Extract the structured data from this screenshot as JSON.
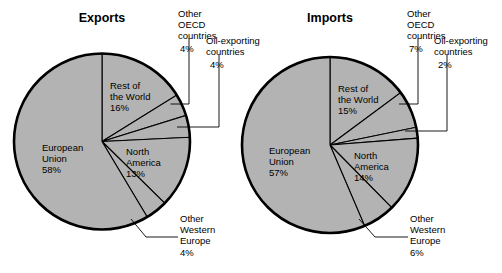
{
  "figure": {
    "background": "#ffffff",
    "slice_fill": "#b3b3b3",
    "outline_color": "#000000"
  },
  "chart_data": [
    {
      "type": "pie",
      "title": "Exports",
      "labels": [
        "Rest of the World",
        "Other OECD countries",
        "Oil-exporting countries",
        "North America",
        "Other Western Europe",
        "European Union"
      ],
      "values": [
        16,
        4,
        4,
        13,
        4,
        58
      ],
      "value_suffix": "%",
      "start_angle_deg": 0,
      "direction": "clockwise",
      "legend": "none",
      "grid": false
    },
    {
      "type": "pie",
      "title": "Imports",
      "labels": [
        "Rest of the World",
        "Other OECD countries",
        "Oil-exporting countries",
        "North America",
        "Other Western Europe",
        "European Union"
      ],
      "values": [
        15,
        7,
        2,
        14,
        6,
        57
      ],
      "value_suffix": "%",
      "start_angle_deg": 0,
      "direction": "clockwise",
      "legend": "none",
      "grid": false
    }
  ],
  "exports": {
    "title": "Exports",
    "inner": {
      "rest_of_world_l1": "Rest of",
      "rest_of_world_l2": "the World",
      "rest_of_world_pct": "16%",
      "european_union_l1": "European",
      "european_union_l2": "Union",
      "european_union_pct": "58%",
      "north_america_l1": "North",
      "north_america_l2": "America",
      "north_america_pct": "13%"
    },
    "callouts": {
      "oecd_l1": "Other",
      "oecd_l2": "OECD",
      "oecd_l3": "countries",
      "oecd_pct": "4%",
      "oil_l1": "Oil-exporting",
      "oil_l2": "countries",
      "oil_pct": "4%",
      "owe_l1": "Other",
      "owe_l2": "Western",
      "owe_l3": "Europe",
      "owe_pct": "4%"
    }
  },
  "imports": {
    "title": "Imports",
    "inner": {
      "rest_of_world_l1": "Rest of",
      "rest_of_world_l2": "the World",
      "rest_of_world_pct": "15%",
      "european_union_l1": "European",
      "european_union_l2": "Union",
      "european_union_pct": "57%",
      "north_america_l1": "North",
      "north_america_l2": "America",
      "north_america_pct": "14%"
    },
    "callouts": {
      "oecd_l1": "Other",
      "oecd_l2": "OECD",
      "oecd_l3": "countries",
      "oecd_pct": "7%",
      "oil_l1": "Oil-exporting",
      "oil_l2": "countries",
      "oil_pct": "2%",
      "owe_l1": "Other",
      "owe_l2": "Western",
      "owe_l3": "Europe",
      "owe_pct": "6%"
    }
  }
}
